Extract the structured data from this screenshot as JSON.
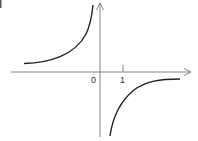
{
  "figure": {
    "type": "hyperbola graph",
    "function_description": "reciprocal-type curve with vertical asymptote at x=0 and horizontal asymptote at y=0; branch in quadrant II rising toward +infinity near x=0, branch in quadrant IV rising from -infinity toward 0",
    "labels": {
      "origin": "0",
      "tick_one": "1"
    },
    "colors": {
      "axis": "#666666",
      "curve": "#222222",
      "background": "#ffffff"
    }
  }
}
